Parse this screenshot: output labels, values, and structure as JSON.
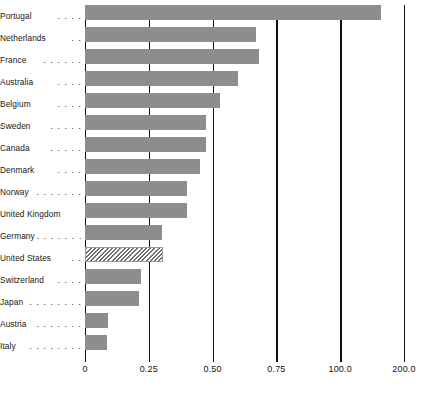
{
  "chart_data": {
    "type": "bar",
    "orientation": "horizontal",
    "title": "",
    "subtitle": "",
    "xlabel": "",
    "ylabel": "",
    "grid": true,
    "legend": null,
    "xlim": [
      0,
      1.25
    ],
    "categories": [
      "Portugal",
      "Netherlands",
      "France",
      "Australia",
      "Belgium",
      "Sweden",
      "Canada",
      "Denmark",
      "Norway",
      "United Kingdom",
      "Germany",
      "United States",
      "Switzerland",
      "Japan",
      "Austria",
      "Italy"
    ],
    "values": [
      1.16,
      0.67,
      0.68,
      0.6,
      0.53,
      0.475,
      0.475,
      0.45,
      0.4,
      0.4,
      0.3,
      0.305,
      0.22,
      0.21,
      0.09,
      0.085
    ],
    "tick_labels": [
      "0",
      "0.25",
      "0.50",
      "0.75",
      "100.0",
      "200.0"
    ],
    "tick_values": [
      0,
      0.25,
      0.5,
      0.75,
      1.0,
      1.25
    ],
    "highlight_category": "United States",
    "highlight_style": "diagonal-hatch",
    "bar_color": "#8d8d8d",
    "axis_color": "#101010",
    "background_color": "#ffffff"
  },
  "labels": {
    "leaders": [
      ". . . .",
      ". .",
      ". . . . . .",
      ". . . .",
      ". . . .",
      ". . . . .",
      ". . . . .",
      ". . . .",
      ". . . . . . .",
      "",
      ". . . . . . .",
      ". .",
      ". . . .",
      ". . . . . . . .",
      ". . . . . . .",
      ". . . . . . . ."
    ]
  }
}
